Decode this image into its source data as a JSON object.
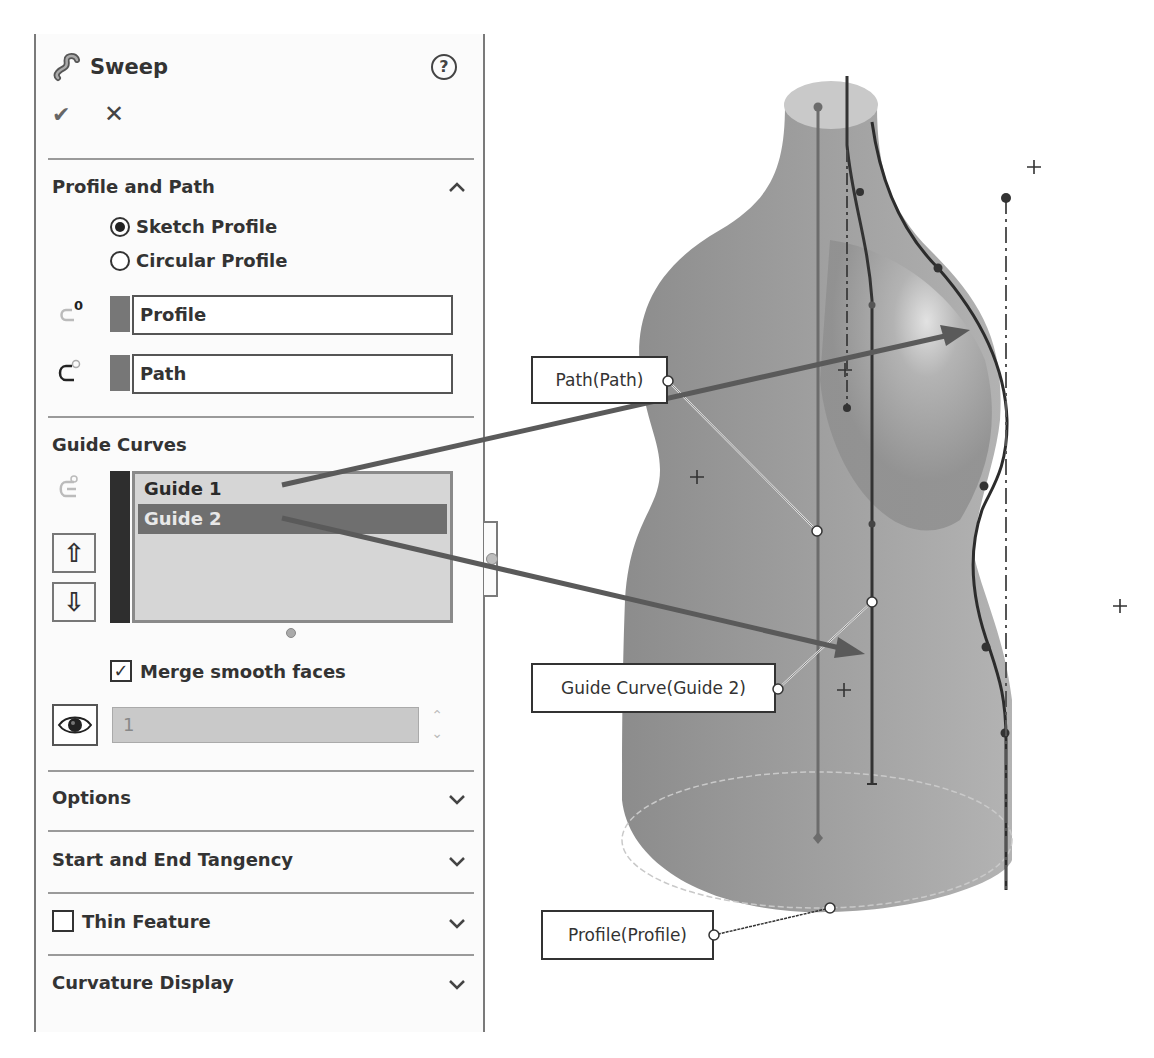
{
  "panel": {
    "title": "Sweep",
    "title_icon": "sweep-feature-icon",
    "help_label": "?",
    "ok_label": "✔",
    "cancel_label": "✕",
    "sections": {
      "profile_path": {
        "title": "Profile and Path",
        "expanded": true,
        "radio_sketch": "Sketch Profile",
        "radio_circular": "Circular Profile",
        "selected_radio": "Sketch Profile",
        "profile_value": "Profile",
        "path_value": "Path",
        "profile_icon": "profile-selection-icon",
        "path_icon": "path-selection-icon"
      },
      "guide_curves": {
        "title": "Guide Curves",
        "items": [
          "Guide 1",
          "Guide 2"
        ],
        "selected_index": 1,
        "move_up_label": "⇧",
        "move_down_label": "⇩",
        "merge_label": "Merge smooth faces",
        "merge_checked": true,
        "sections_value": "1",
        "spin_up": "⌃",
        "spin_down": "⌄"
      },
      "options": {
        "title": "Options"
      },
      "tangency": {
        "title": "Start and End Tangency"
      },
      "thin": {
        "title": "Thin Feature",
        "checked": false
      },
      "curvature": {
        "title": "Curvature Display"
      }
    }
  },
  "viewport": {
    "callouts": {
      "path": "Path(Path)",
      "guide": "Guide Curve(Guide 2)",
      "profile": "Profile(Profile)"
    },
    "colors": {
      "body": "#9a9a9a",
      "body_light": "#d8d8d8",
      "curve": "#3a3a3a",
      "arrow": "#5a5a5a"
    }
  }
}
